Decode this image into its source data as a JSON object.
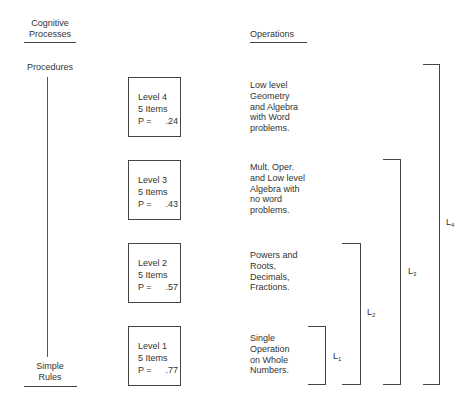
{
  "left_axis": {
    "header_line1": "Cognitive",
    "header_line2": "Processes",
    "top_label": "Procedures",
    "bottom_label_line1": "Simple",
    "bottom_label_line2": "Rules"
  },
  "right_header": "Operations",
  "levels": [
    {
      "name": "Level 4",
      "items": "5 Items",
      "p_label": "P =",
      "p_value": ".24",
      "operations": [
        "Low level",
        "Geometry",
        "and Algebra",
        "with Word",
        "problems."
      ]
    },
    {
      "name": "Level 3",
      "items": "5 Items",
      "p_label": "P =",
      "p_value": ".43",
      "operations": [
        "Mult. Oper.",
        "and Low level",
        "Algebra with",
        "no word",
        "problems."
      ]
    },
    {
      "name": "Level 2",
      "items": "5 Items",
      "p_label": "P =",
      "p_value": ".57",
      "operations": [
        "Powers and",
        "Roots,",
        "Decimals,",
        "Fractions."
      ]
    },
    {
      "name": "Level 1",
      "items": "5 Items",
      "p_label": "P =",
      "p_value": ".77",
      "operations": [
        "Single",
        "Operation",
        "on Whole",
        "Numbers."
      ]
    }
  ],
  "brackets": [
    {
      "base": "L",
      "sub": "1"
    },
    {
      "base": "L",
      "sub": "2"
    },
    {
      "base": "L",
      "sub": "3"
    },
    {
      "base": "L",
      "sub": "4"
    }
  ]
}
